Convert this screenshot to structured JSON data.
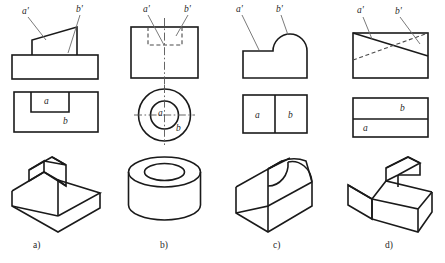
{
  "figure": {
    "stroke_color": "#1a1a1a",
    "hidden_line_color": "#4a4a4a",
    "center_line_color": "#555555",
    "leader_color": "#6b6b6b",
    "background": "#ffffff"
  },
  "columns": [
    {
      "key": "a",
      "caption": "a)",
      "front_view": {
        "name": "front-view-a",
        "description": "base rectangle with wedge prism on top",
        "labels": [
          {
            "text": "a'",
            "x": 22,
            "y": 8
          },
          {
            "text": "b'",
            "x": 76,
            "y": 6
          }
        ]
      },
      "top_view": {
        "name": "top-view-a",
        "description": "rectangle containing an inner rectangle at top edge",
        "face_labels": [
          {
            "text": "a",
            "x": 44,
            "y": 99
          },
          {
            "text": "b",
            "x": 63,
            "y": 120
          }
        ]
      },
      "pictorial": {
        "name": "pictorial-a",
        "description": "isometric of base block with sloped wedge"
      }
    },
    {
      "key": "b",
      "caption": "b)",
      "front_view": {
        "name": "front-view-b",
        "description": "rectangle with hidden counterbore and vertical centerline",
        "labels": [
          {
            "text": "a'",
            "x": 143,
            "y": 6
          },
          {
            "text": "b'",
            "x": 184,
            "y": 6
          }
        ]
      },
      "top_view": {
        "name": "top-view-b",
        "description": "two concentric circles with crossing centerlines",
        "face_labels": [
          {
            "text": "a",
            "x": 160,
            "y": 114
          },
          {
            "text": "b",
            "x": 177,
            "y": 128
          }
        ]
      },
      "pictorial": {
        "name": "pictorial-b",
        "description": "isometric of hollow cylinder"
      }
    },
    {
      "key": "c",
      "caption": "c)",
      "front_view": {
        "name": "front-view-c",
        "description": "rectangle with semicircular dome on the right",
        "labels": [
          {
            "text": "a'",
            "x": 237,
            "y": 6
          },
          {
            "text": "b'",
            "x": 277,
            "y": 6
          }
        ]
      },
      "top_view": {
        "name": "top-view-c",
        "description": "rectangle divided by a vertical line into two faces",
        "face_labels": [
          {
            "text": "a",
            "x": 250,
            "y": 118
          },
          {
            "text": "b",
            "x": 288,
            "y": 117
          }
        ]
      },
      "pictorial": {
        "name": "pictorial-c",
        "description": "isometric of block with half cylinder on top"
      }
    },
    {
      "key": "d",
      "caption": "d)",
      "front_view": {
        "name": "front-view-d",
        "description": "rectangle with crossing solid and hidden diagonals",
        "labels": [
          {
            "text": "a'",
            "x": 358,
            "y": 6
          },
          {
            "text": "b'",
            "x": 396,
            "y": 8
          }
        ]
      },
      "top_view": {
        "name": "top-view-d",
        "description": "rectangle divided by a horizontal line into two faces",
        "face_labels": [
          {
            "text": "b",
            "x": 402,
            "y": 111
          },
          {
            "text": "a",
            "x": 363,
            "y": 131
          }
        ]
      },
      "pictorial": {
        "name": "pictorial-d",
        "description": "isometric of block with angled wedge cut"
      }
    }
  ],
  "captions": {
    "a": {
      "text": "a)",
      "x": 33,
      "y": 242
    },
    "b": {
      "text": "b)",
      "x": 160,
      "y": 242
    },
    "c": {
      "text": "c)",
      "x": 273,
      "y": 242
    },
    "d": {
      "text": "d)",
      "x": 385,
      "y": 242
    }
  }
}
